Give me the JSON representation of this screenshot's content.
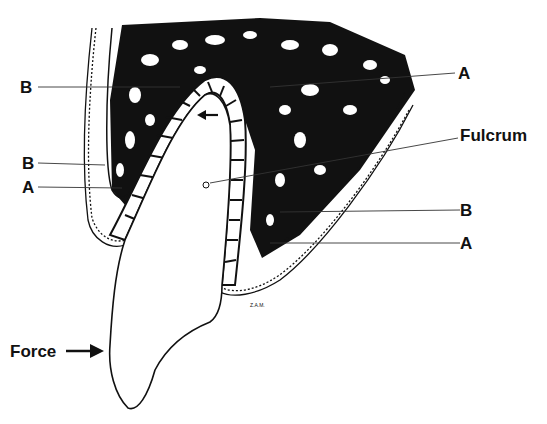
{
  "figure": {
    "labels": {
      "b_top": "B",
      "a_top": "A",
      "fulcrum": "Fulcrum",
      "b_left": "B",
      "a_left": "A",
      "b_right": "B",
      "a_right": "A",
      "force": "Force"
    },
    "artist_initials": "Z.A.M.",
    "colors": {
      "ink": "#111111",
      "paper": "#ffffff"
    }
  }
}
